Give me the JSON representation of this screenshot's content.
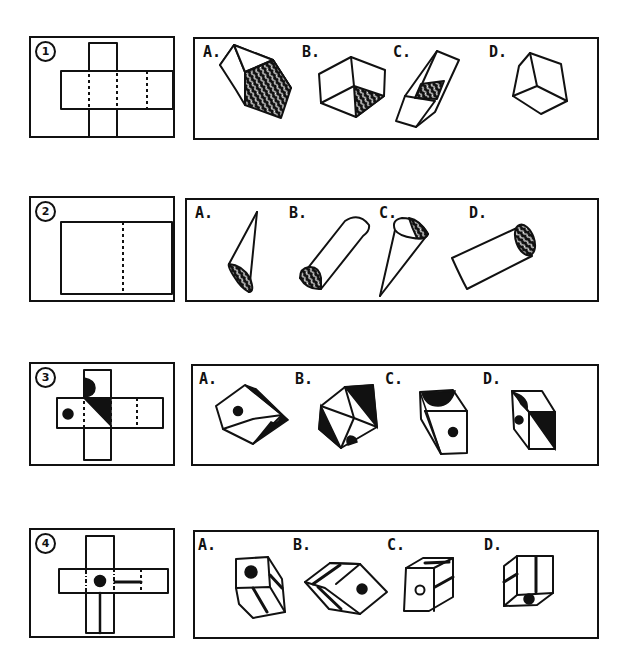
{
  "problems": [
    {
      "number": "1",
      "net": "cross-shaped net of five squares with an extra square on the right arm; dashed fold lines",
      "options": [
        {
          "label": "A.",
          "description": "cube with hatched front-right face"
        },
        {
          "label": "B.",
          "description": "open box seen from inside, hatched bottom-right triangle"
        },
        {
          "label": "C.",
          "description": "long open tray with hatched inner bottom"
        },
        {
          "label": "D.",
          "description": "plain hexagonal outline of a cube"
        }
      ]
    },
    {
      "number": "2",
      "net": "rectangle divided by a vertical dashed fold line",
      "options": [
        {
          "label": "A.",
          "description": "cone with hatched base at bottom"
        },
        {
          "label": "B.",
          "description": "half cylinder with hatched semicircular end"
        },
        {
          "label": "C.",
          "description": "cone with partly hatched base at top"
        },
        {
          "label": "D.",
          "description": "cylinder with hatched end"
        }
      ]
    },
    {
      "number": "3",
      "net": "cross net with black semicircle on top square, black dot on left square, black diagonal half on center-right square",
      "options": [
        {
          "label": "A.",
          "description": "cube with dot on top face, black side face and black half-circle"
        },
        {
          "label": "B.",
          "description": "cube with black triangle faces and dot"
        },
        {
          "label": "C.",
          "description": "cube with dot on front, black half-circle top and black left side"
        },
        {
          "label": "D.",
          "description": "cube with diagonal black half face, dot and half-circle"
        }
      ]
    },
    {
      "number": "4",
      "net": "cross net with black dot in center, horizontal bar on right arm, vertical bar on bottom arm, dash-dot fold lines",
      "options": [
        {
          "label": "A.",
          "description": "cube with dot on front, stripes on side and bottom"
        },
        {
          "label": "B.",
          "description": "cube with dot and double stripes"
        },
        {
          "label": "C.",
          "description": "cube with hollow circle on front, stripes on top and side"
        },
        {
          "label": "D.",
          "description": "cube with vertical stripe, horizontal stripe and dot on bottom"
        }
      ]
    }
  ]
}
